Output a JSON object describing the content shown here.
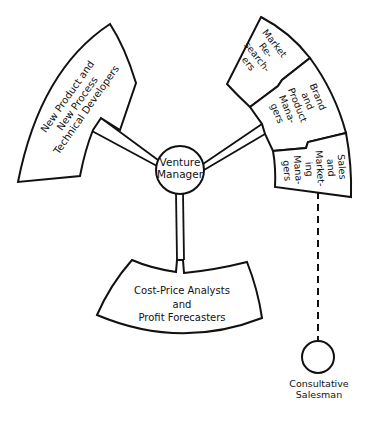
{
  "diagram": {
    "center_node": {
      "lines": [
        "Venture",
        "Manager"
      ]
    },
    "blocks": {
      "technical": {
        "lines": [
          "New Product and",
          "New Process",
          "Technical Developers"
        ]
      },
      "market_research": {
        "lines": [
          "Market",
          "Re-",
          "search-",
          "ers"
        ]
      },
      "brand_product": {
        "lines": [
          "Brand",
          "and",
          "Product",
          "Mana-",
          "gers"
        ]
      },
      "sales_marketing": {
        "lines": [
          "Sales",
          "and",
          "Market-",
          "ing",
          "Mana-",
          "gers"
        ]
      },
      "cost_price": {
        "lines": [
          "Cost-Price Analysts",
          "and",
          "Profit Forecasters"
        ]
      }
    },
    "external_node": {
      "lines": [
        "Consultative",
        "Salesman"
      ]
    },
    "colors": {
      "stroke": "#111111",
      "fill": "#ffffff",
      "background": "#ffffff"
    }
  }
}
